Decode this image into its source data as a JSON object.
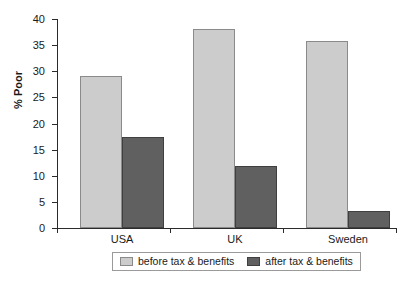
{
  "chart_data": {
    "type": "bar",
    "title": "",
    "xlabel": "",
    "ylabel": "% Poor",
    "categories": [
      "USA",
      "UK",
      "Sweden"
    ],
    "ylim": [
      0,
      40
    ],
    "yticks": [
      0,
      5,
      10,
      15,
      20,
      25,
      30,
      35,
      40
    ],
    "ytick_labels": [
      "0",
      "5",
      "10",
      "15",
      "20",
      "25",
      "30",
      "35",
      "40"
    ],
    "grid": false,
    "legend_position": "bottom",
    "series": [
      {
        "name": "before tax & benefits",
        "color": "#cccccc",
        "values": [
          29,
          38,
          35.8
        ]
      },
      {
        "name": "after tax & benefits",
        "color": "#606060",
        "values": [
          17.4,
          11.8,
          3.3
        ]
      }
    ]
  }
}
